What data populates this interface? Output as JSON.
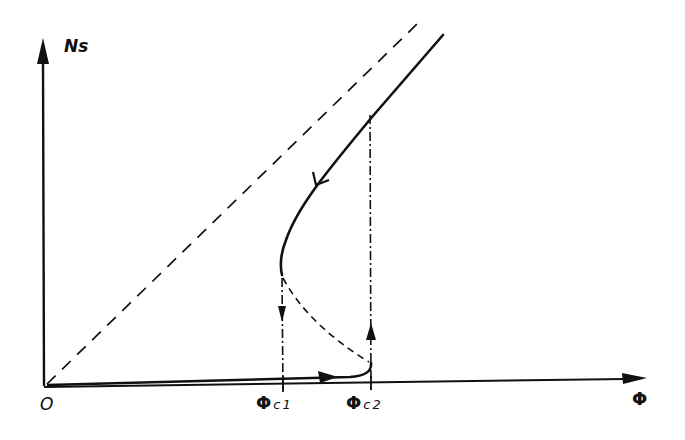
{
  "diagram": {
    "type": "hysteresis-curve",
    "axes": {
      "y_label": "Ns",
      "x_label": "Φ",
      "origin_label": "O"
    },
    "markers": {
      "phi_c1": {
        "symbol": "Φ",
        "subscript": "c1"
      },
      "phi_c2": {
        "symbol": "Φ",
        "subscript": "c2"
      }
    },
    "curves": [
      {
        "name": "upper-stable-branch",
        "style": "solid",
        "direction": "decreasing Φ (arrow pointing down-left)"
      },
      {
        "name": "unstable-branch",
        "style": "dashed",
        "from": "Φc1 turning point",
        "to": "Φc2 turning point"
      },
      {
        "name": "lower-stable-branch",
        "style": "solid",
        "direction": "increasing Φ (arrow pointing right)"
      },
      {
        "name": "asymptote",
        "style": "long-dashed",
        "from": "origin",
        "note": "diagonal line Ns ∝ Φ"
      },
      {
        "name": "jump-down-at-phi-c1",
        "style": "dash-dot",
        "direction": "down"
      },
      {
        "name": "jump-up-at-phi-c2",
        "style": "dash-dot",
        "direction": "up"
      }
    ],
    "colors": {
      "ink": "#111111",
      "background": "#ffffff"
    }
  }
}
